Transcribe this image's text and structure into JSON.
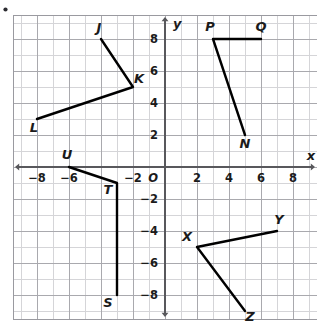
{
  "figure": {
    "kind": "coordinate-plane-diagram",
    "bullet_marker": "•",
    "background_color": "#ffffff",
    "grid_minor_color": "#d5d5d8",
    "grid_major_color": "#a9a9ae",
    "grid_border_color": "#9a9aa0",
    "axis_color": "#58585c",
    "segment_color": "#000000",
    "label_color": "#1b1b1b"
  },
  "chart_data": {
    "type": "scatter",
    "title": "",
    "xlabel": "x",
    "ylabel": "y",
    "grid": true,
    "origin_label": "O",
    "xlim": [
      -9.5,
      9.5
    ],
    "ylim": [
      -9.5,
      9.5
    ],
    "x_tick_values": [
      -8,
      -6,
      -2,
      2,
      4,
      6,
      8
    ],
    "x_tick_labels": [
      "−8",
      "−6",
      "−2",
      "2",
      "4",
      "6",
      "8"
    ],
    "y_tick_values": [
      8,
      6,
      4,
      2,
      -2,
      -4,
      -6,
      -8
    ],
    "y_tick_labels": [
      "8",
      "6",
      "4",
      "2",
      "−2",
      "−4",
      "−6",
      "−8"
    ],
    "tick_step": 2,
    "minor_step": 1,
    "axis_arrows": [
      "left",
      "right",
      "up",
      "down"
    ],
    "figures": [
      {
        "name": "figure-jkl",
        "vertices": [
          {
            "label": "J",
            "x": -4,
            "y": 8,
            "label_dx": -2,
            "label_dy": -7
          },
          {
            "label": "K",
            "x": -2,
            "y": 5,
            "label_dx": 6,
            "label_dy": -4
          },
          {
            "label": "L",
            "x": -8,
            "y": 3,
            "label_dx": -3,
            "label_dy": 13
          }
        ],
        "path": [
          "J",
          "K",
          "L"
        ]
      },
      {
        "name": "figure-pqn",
        "vertices": [
          {
            "label": "Q",
            "x": 6,
            "y": 8,
            "label_dx": 0,
            "label_dy": -8
          },
          {
            "label": "P",
            "x": 3,
            "y": 8,
            "label_dx": -3,
            "label_dy": -8
          },
          {
            "label": "N",
            "x": 5,
            "y": 2,
            "label_dx": 0,
            "label_dy": 13
          }
        ],
        "path": [
          "Q",
          "P",
          "N"
        ]
      },
      {
        "name": "figure-uts",
        "vertices": [
          {
            "label": "U",
            "x": -6,
            "y": 0,
            "label_dx": -2,
            "label_dy": -8
          },
          {
            "label": "T",
            "x": -3,
            "y": -1,
            "label_dx": -9,
            "label_dy": 11
          },
          {
            "label": "S",
            "x": -3,
            "y": -8,
            "label_dx": -9,
            "label_dy": 12
          }
        ],
        "path": [
          "U",
          "T",
          "S"
        ]
      },
      {
        "name": "figure-xyz",
        "vertices": [
          {
            "label": "Y",
            "x": 7,
            "y": -4,
            "label_dx": 2,
            "label_dy": -7
          },
          {
            "label": "X",
            "x": 2,
            "y": -5,
            "label_dx": -10,
            "label_dy": -6
          },
          {
            "label": "Z",
            "x": 5,
            "y": -9,
            "label_dx": 5,
            "label_dy": 10
          }
        ],
        "path": [
          "Y",
          "X",
          "Z"
        ]
      }
    ]
  }
}
